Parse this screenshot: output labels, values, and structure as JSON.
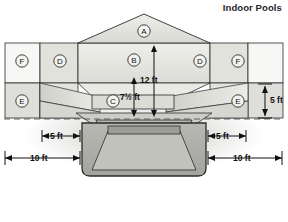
{
  "title": "Indoor Pools",
  "figure": {
    "regions": [
      {
        "key": "A",
        "label": "A",
        "cx": 144,
        "cy": 31
      },
      {
        "key": "B",
        "label": "B",
        "cx": 134,
        "cy": 60
      },
      {
        "key": "C",
        "label": "C",
        "cx": 113,
        "cy": 101
      },
      {
        "key": "D_left",
        "label": "D",
        "cx": 60,
        "cy": 61
      },
      {
        "key": "D_right",
        "label": "D",
        "cx": 200,
        "cy": 61
      },
      {
        "key": "E_left",
        "label": "E",
        "cx": 22,
        "cy": 101
      },
      {
        "key": "E_right",
        "label": "E",
        "cx": 238,
        "cy": 101
      },
      {
        "key": "F_left",
        "label": "F",
        "cx": 22,
        "cy": 61
      },
      {
        "key": "F_right",
        "label": "F",
        "cx": 238,
        "cy": 61
      }
    ],
    "dimensions": [
      {
        "key": "height_12ft",
        "text": "12 ft",
        "value": 12,
        "unit": "ft",
        "orientation": "vertical",
        "x": 154,
        "y": 80
      },
      {
        "key": "height_7half_ft",
        "text": "7½ ft",
        "value": 7.5,
        "unit": "ft",
        "orientation": "vertical",
        "x": 122,
        "y": 97
      },
      {
        "key": "side_5ft_right",
        "text": "5 ft",
        "value": 5,
        "unit": "ft",
        "orientation": "vertical",
        "x": 266,
        "y": 96
      },
      {
        "key": "width_5ft_left",
        "text": "5 ft",
        "value": 5,
        "unit": "ft",
        "orientation": "horizontal",
        "x": 56,
        "y": 136
      },
      {
        "key": "width_5ft_right",
        "text": "5 ft",
        "value": 5,
        "unit": "ft",
        "orientation": "horizontal",
        "x": 206,
        "y": 136
      },
      {
        "key": "width_10ft_left",
        "text": "10 ft",
        "value": 10,
        "unit": "ft",
        "orientation": "horizontal",
        "x": 38,
        "y": 158
      },
      {
        "key": "width_10ft_right",
        "text": "10 ft",
        "value": 10,
        "unit": "ft",
        "orientation": "horizontal",
        "x": 224,
        "y": 158
      }
    ],
    "colors": {
      "outline": "#2b2b2b",
      "fill_white": "#f7f7f5",
      "fill_light": "#e6e6e2",
      "fill_mid": "#d3d3ce",
      "fill_dark": "#bcbcb6",
      "fill_deep": "#a8a8a2",
      "dash": "#555555",
      "title": "#23262b"
    }
  }
}
